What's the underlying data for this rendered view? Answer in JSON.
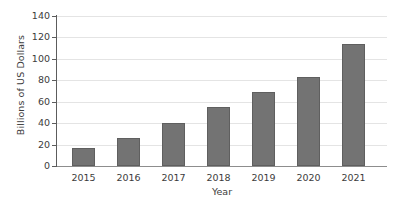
{
  "chart_data": {
    "type": "bar",
    "title": "",
    "xlabel": "Year",
    "ylabel": "Billions of US Dollars",
    "categories": [
      "2015",
      "2016",
      "2017",
      "2018",
      "2019",
      "2020",
      "2021"
    ],
    "values": [
      17,
      26,
      40,
      55,
      69,
      83,
      114
    ],
    "ylim": [
      0,
      140
    ],
    "ytick_labels": [
      "0",
      "20",
      "40",
      "60",
      "80",
      "100",
      "120",
      "140"
    ],
    "ytick_values": [
      0,
      20,
      40,
      60,
      80,
      100,
      120,
      140
    ],
    "grid": "horizontal",
    "legend": "none",
    "series": [
      {
        "name": "Billions of US Dollars",
        "values": [
          17,
          26,
          40,
          55,
          69,
          83,
          114
        ]
      }
    ],
    "colors": {
      "bar_fill": "#737373",
      "bar_border": "#5f5f5f",
      "gridline": "#e4e4e4",
      "axis": "#5c5c5c",
      "text": "#3c3c3c",
      "background": "#ffffff"
    }
  }
}
